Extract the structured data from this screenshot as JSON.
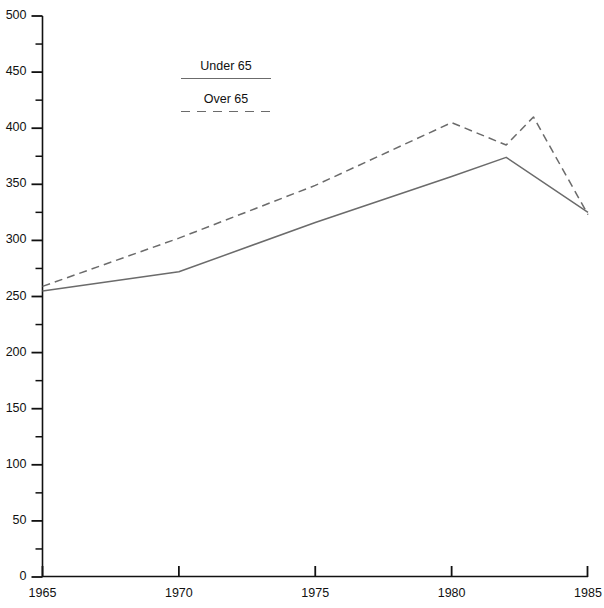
{
  "chart_data": {
    "type": "line",
    "title": "",
    "xlabel": "",
    "ylabel": "",
    "xlim": [
      1965,
      1985
    ],
    "ylim": [
      0,
      500
    ],
    "grid": false,
    "legend_position": "top-center",
    "x_ticks": [
      "1965",
      "1970",
      "1975",
      "1980",
      "1985"
    ],
    "x_tick_values": [
      1965,
      1970,
      1975,
      1980,
      1985
    ],
    "x_minor_step": 1,
    "y_ticks": [
      "0",
      "50",
      "100",
      "150",
      "200",
      "250",
      "300",
      "350",
      "400",
      "450",
      "500"
    ],
    "y_tick_values": [
      0,
      50,
      100,
      150,
      200,
      250,
      300,
      350,
      400,
      450,
      500
    ],
    "y_minor_step": 25,
    "series": [
      {
        "name": "Under 65",
        "style": "solid",
        "color": "#6b6b6b",
        "x": [
          1965,
          1970,
          1975,
          1980,
          1982,
          1985
        ],
        "values": [
          255,
          272,
          316,
          357,
          374,
          325
        ]
      },
      {
        "name": "Over 65",
        "style": "dashed",
        "color": "#6b6b6b",
        "x": [
          1965,
          1970,
          1975,
          1980,
          1982,
          1983,
          1985
        ],
        "values": [
          259,
          302,
          349,
          405,
          385,
          410,
          323
        ]
      }
    ]
  },
  "legend": {
    "entries": [
      {
        "label": "Under 65",
        "style": "solid"
      },
      {
        "label": "Over 65",
        "style": "dashed"
      }
    ]
  },
  "axis": {
    "y_labels": [
      "500",
      "450",
      "400",
      "350",
      "300",
      "250",
      "200",
      "150",
      "100",
      "50",
      "0"
    ],
    "x_labels": [
      "1965",
      "1970",
      "1975",
      "1980",
      "1985"
    ]
  }
}
